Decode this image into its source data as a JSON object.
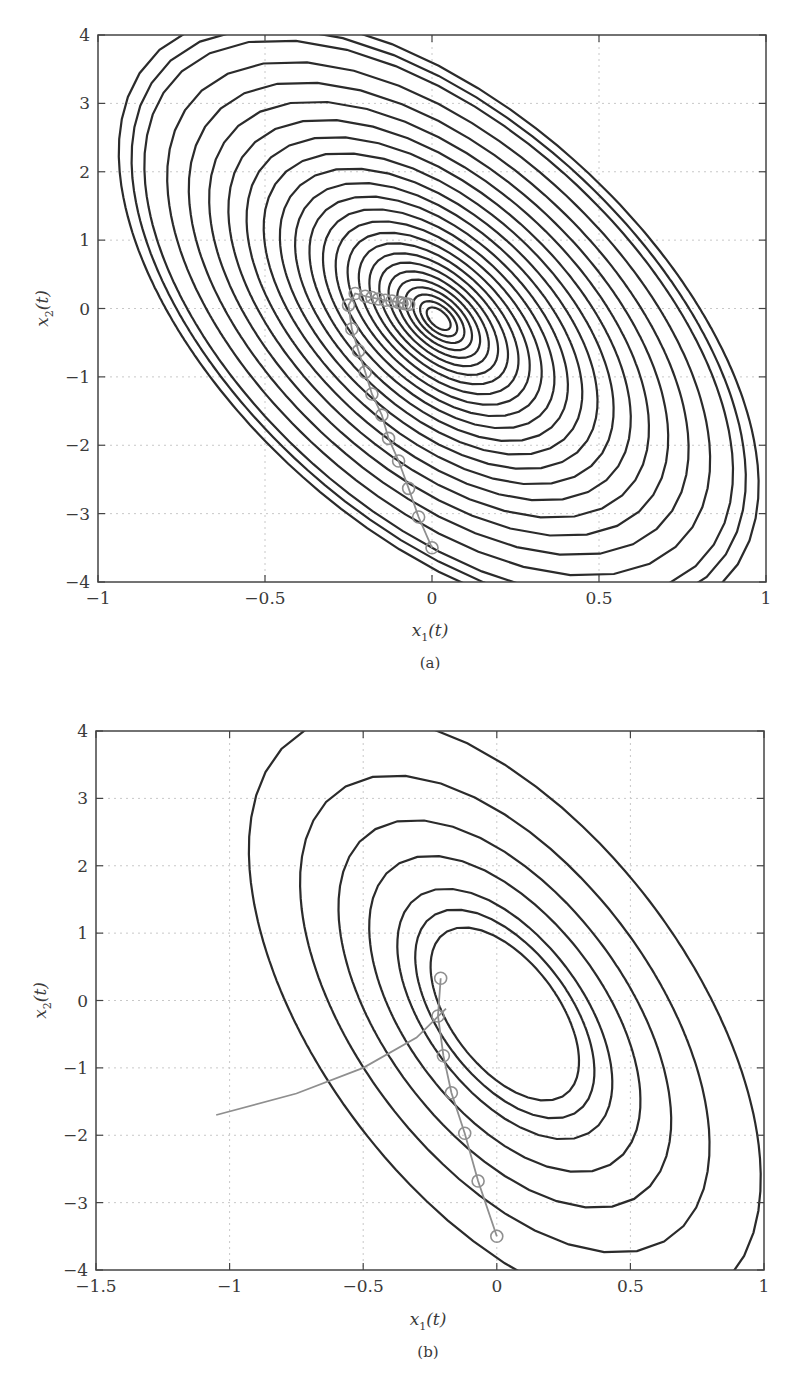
{
  "chart_data": [
    {
      "panel": "(a)",
      "type": "line",
      "title": "",
      "xlabel": "x1(t)",
      "ylabel": "x2(t)",
      "xlim": [
        -1,
        1
      ],
      "ylim": [
        -4,
        4
      ],
      "xticks": [
        -1,
        -0.5,
        0,
        0.5,
        1
      ],
      "yticks": [
        -4,
        -3,
        -2,
        -1,
        0,
        1,
        2,
        3,
        4
      ],
      "xtick_labels": [
        "−1",
        "−0.5",
        "0",
        "0.5",
        "1"
      ],
      "ytick_labels": [
        "−4",
        "−3",
        "−2",
        "−1",
        "0",
        "1",
        "2",
        "3",
        "4"
      ],
      "grid": true,
      "legend": null,
      "series": [
        {
          "name": "level-set contours",
          "kind": "contour",
          "color": "#2b2b2b",
          "center": [
            0.02,
            -0.15
          ],
          "rotation_deg": -45,
          "count": 24,
          "outer_extent": {
            "x": [
              -0.83,
              0.83
            ],
            "y": [
              -3.85,
              3.85
            ]
          }
        },
        {
          "name": "trajectory",
          "kind": "line+markers",
          "color": "#8f8f8f",
          "marker": "open-circle",
          "points": [
            [
              0.0,
              -3.5
            ],
            [
              -0.04,
              -3.05
            ],
            [
              -0.07,
              -2.63
            ],
            [
              -0.1,
              -2.23
            ],
            [
              -0.13,
              -1.9
            ],
            [
              -0.15,
              -1.56
            ],
            [
              -0.18,
              -1.25
            ],
            [
              -0.2,
              -0.93
            ],
            [
              -0.22,
              -0.62
            ],
            [
              -0.24,
              -0.3
            ],
            [
              -0.25,
              0.05
            ],
            [
              -0.23,
              0.22
            ],
            [
              -0.2,
              0.18
            ],
            [
              -0.18,
              0.16
            ],
            [
              -0.16,
              0.14
            ],
            [
              -0.14,
              0.12
            ],
            [
              -0.12,
              0.11
            ],
            [
              -0.1,
              0.09
            ],
            [
              -0.09,
              0.08
            ],
            [
              -0.08,
              0.07
            ],
            [
              -0.07,
              0.06
            ]
          ]
        }
      ]
    },
    {
      "panel": "(b)",
      "type": "line",
      "title": "",
      "xlabel": "x1(t)",
      "ylabel": "x2(t)",
      "xlim": [
        -1.5,
        1
      ],
      "ylim": [
        -4,
        4
      ],
      "xticks": [
        -1.5,
        -1,
        -0.5,
        0,
        0.5,
        1
      ],
      "yticks": [
        -4,
        -3,
        -2,
        -1,
        0,
        1,
        2,
        3,
        4
      ],
      "xtick_labels": [
        "−1.5",
        "−1",
        "−0.5",
        "0",
        "0.5",
        "1"
      ],
      "ytick_labels": [
        "−4",
        "−3",
        "−2",
        "−1",
        "0",
        "1",
        "2",
        "3",
        "4"
      ],
      "grid": true,
      "legend": null,
      "series": [
        {
          "name": "level-set contours",
          "kind": "contour",
          "color": "#2b2b2b",
          "center": [
            0.03,
            -0.2
          ],
          "rotation_deg": -45,
          "count": 7,
          "outer_extent": {
            "x": [
              -0.83,
              0.83
            ],
            "y": [
              -3.85,
              3.85
            ]
          }
        },
        {
          "name": "trajectory",
          "kind": "line+markers",
          "color": "#8f8f8f",
          "marker": "open-circle",
          "points": [
            [
              0.0,
              -3.5
            ],
            [
              -0.07,
              -2.68
            ],
            [
              -0.12,
              -1.97
            ],
            [
              -0.17,
              -1.37
            ],
            [
              -0.2,
              -0.82
            ],
            [
              -0.22,
              -0.23
            ],
            [
              -0.21,
              0.33
            ]
          ]
        },
        {
          "name": "escaping branch",
          "kind": "line",
          "color": "#8f8f8f",
          "points": [
            [
              -0.19,
              -0.12
            ],
            [
              -0.3,
              -0.55
            ],
            [
              -0.5,
              -1.0
            ],
            [
              -0.75,
              -1.38
            ],
            [
              -1.05,
              -1.7
            ]
          ]
        }
      ]
    }
  ],
  "captions": {
    "a": "(a)",
    "b": "(b)"
  },
  "labels": {
    "x_main": "x",
    "x_sub": "1",
    "x_arg": "(t)",
    "y_main": "x",
    "y_sub": "2",
    "y_arg": "(t)"
  }
}
